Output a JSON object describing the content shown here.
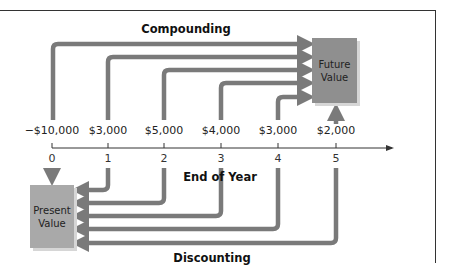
{
  "diagram": {
    "top_title": "Compounding",
    "bottom_title": "Discounting",
    "axis_label": "End of Year",
    "future_value_box": {
      "line1": "Future",
      "line2": "Value"
    },
    "present_value_box": {
      "line1": "Present",
      "line2": "Value"
    },
    "cash_flows": [
      {
        "year": "0",
        "amount": "−$10,000"
      },
      {
        "year": "1",
        "amount": "$3,000"
      },
      {
        "year": "2",
        "amount": "$5,000"
      },
      {
        "year": "3",
        "amount": "$4,000"
      },
      {
        "year": "4",
        "amount": "$3,000"
      },
      {
        "year": "5",
        "amount": "$2,000"
      }
    ],
    "colors": {
      "arrow": "#7a7a7a",
      "future_box": "#8f8f8f",
      "present_box": "#a9a9a9",
      "axis": "#333333"
    }
  }
}
